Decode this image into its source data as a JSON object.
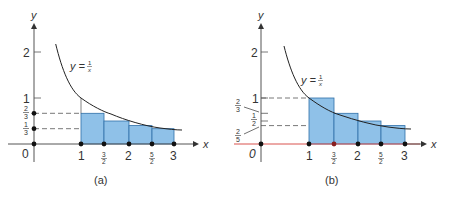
{
  "figure": {
    "panels": [
      {
        "id": "a",
        "caption": "(a)",
        "curve_label": "y = 1/x",
        "curve_label_parts": {
          "lhs": "y =",
          "num": "1",
          "den": "x"
        },
        "x_axis_label": "x",
        "y_axis_label": "y",
        "origin_label": "0",
        "x_ticks": [
          {
            "value": 1,
            "label": "1"
          },
          {
            "value": 1.5,
            "label_num": "3",
            "label_den": "2"
          },
          {
            "value": 2,
            "label": "2"
          },
          {
            "value": 2.5,
            "label_num": "5",
            "label_den": "2"
          },
          {
            "value": 3,
            "label": "3"
          }
        ],
        "y_ticks": [
          {
            "value": 1,
            "label": "1"
          },
          {
            "value": 2,
            "label": "2"
          }
        ],
        "y_marks": [
          {
            "value": 0.6667,
            "label_num": "2",
            "label_den": "3"
          },
          {
            "value": 0.3333,
            "label_num": "1",
            "label_den": "3"
          }
        ],
        "rectangles": "right-endpoint (lower sum)",
        "rect_heights": [
          0.6667,
          0.5,
          0.4,
          0.3333
        ]
      },
      {
        "id": "b",
        "caption": "(b)",
        "curve_label": "y = 1/x",
        "curve_label_parts": {
          "lhs": "y =",
          "num": "1",
          "den": "x"
        },
        "x_axis_label": "x",
        "y_axis_label": "y",
        "origin_label": "0",
        "x_ticks": [
          {
            "value": 1,
            "label": "1"
          },
          {
            "value": 1.5,
            "label_num": "3",
            "label_den": "2"
          },
          {
            "value": 2,
            "label": "2"
          },
          {
            "value": 2.5,
            "label_num": "5",
            "label_den": "2"
          },
          {
            "value": 3,
            "label": "3"
          }
        ],
        "y_ticks": [
          {
            "value": 1,
            "label": "1"
          },
          {
            "value": 2,
            "label": "2"
          }
        ],
        "y_marks": [
          {
            "value": 0.6667,
            "label_num": "2",
            "label_den": "3"
          },
          {
            "value": 0.5,
            "label_num": "1",
            "label_den": "2"
          },
          {
            "value": 0.4,
            "label_num": "2",
            "label_den": "5"
          }
        ],
        "rectangles": "left-endpoint (upper sum)",
        "rect_heights": [
          1,
          0.6667,
          0.5,
          0.4
        ]
      }
    ],
    "colors": {
      "fill": "#8fc1e8",
      "edge": "#2f6fa8",
      "curve": "#222222",
      "axis": "#555555",
      "axis_b_red": "#d9534f",
      "dot": "#111111"
    }
  }
}
